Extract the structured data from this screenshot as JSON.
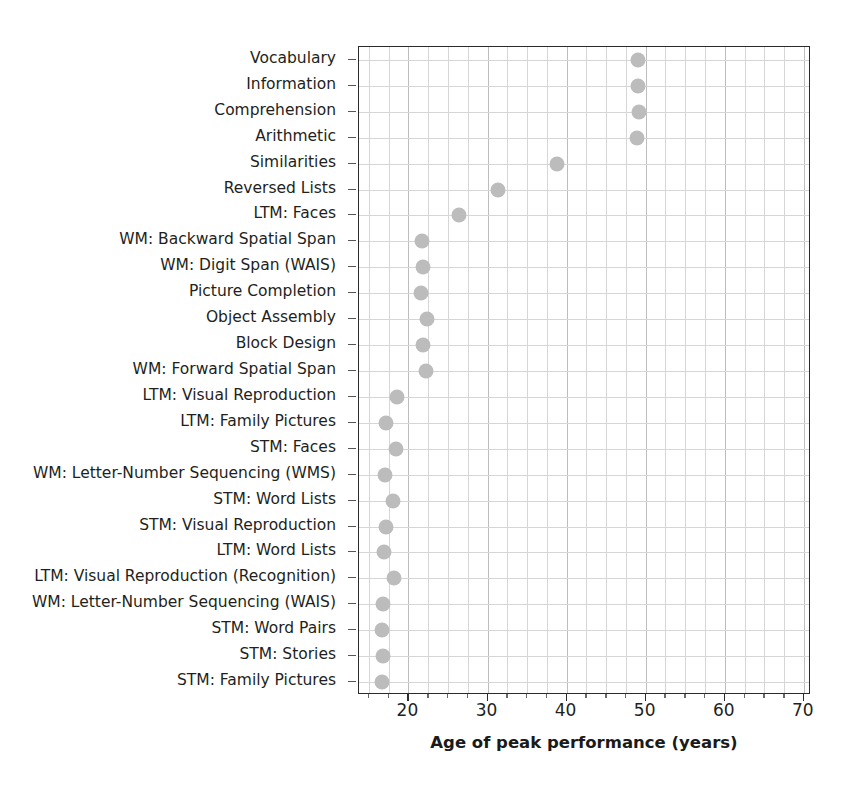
{
  "chart_data": {
    "type": "scatter",
    "title": "",
    "subtitle": "",
    "xlabel": "Age of peak performance (years)",
    "ylabel": "",
    "xlim": [
      13.75,
      70.9
    ],
    "ylim": [
      0,
      24
    ],
    "grid": true,
    "legend_position": "none",
    "orientation": "horizontal-dot-plot",
    "marker": {
      "shape": "circle",
      "color": "#bcbcbc",
      "size": 15
    },
    "xticks": [
      20,
      30,
      40,
      50,
      60,
      70
    ],
    "xtick_labels": [
      "20",
      "30",
      "40",
      "50",
      "60",
      "70"
    ],
    "xminor_step": 2.5,
    "categories": [
      "Vocabulary",
      "Information",
      "Comprehension",
      "Arithmetic",
      "Similarities",
      "Reversed Lists",
      "LTM: Faces",
      "WM: Backward Spatial Span",
      "WM: Digit Span (WAIS)",
      "Picture Completion",
      "Object Assembly",
      "Block Design",
      "WM: Forward Spatial Span",
      "LTM: Visual Reproduction",
      "LTM: Family Pictures",
      "STM: Faces",
      "WM: Letter-Number Sequencing (WMS)",
      "STM: Word Lists",
      "STM: Visual Reproduction",
      "LTM: Word Lists",
      "LTM: Visual Reproduction (Recognition)",
      "WM: Letter-Number Sequencing (WAIS)",
      "STM: Word Pairs",
      "STM: Stories",
      "STM: Family Pictures"
    ],
    "values": [
      49.0,
      49.0,
      49.2,
      48.9,
      38.8,
      31.3,
      26.4,
      21.7,
      21.8,
      21.6,
      22.3,
      21.8,
      22.2,
      18.6,
      17.2,
      18.4,
      17.1,
      18.1,
      17.2,
      16.9,
      18.2,
      16.8,
      16.7,
      16.8,
      16.6
    ]
  }
}
